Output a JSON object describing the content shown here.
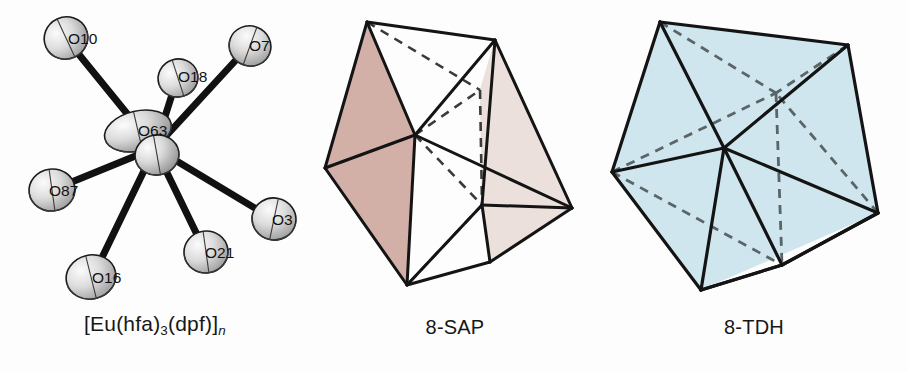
{
  "figure": {
    "type": "scientific-figure",
    "background_color": "#fdfdfd"
  },
  "panels": [
    {
      "id": "ortep",
      "kind": "ortep-crystal-structure",
      "caption": {
        "full_text": "[Eu(hfa)3(dpf)]n",
        "parts": [
          {
            "text": "[Eu(hfa)",
            "style": "normal"
          },
          {
            "text": "3",
            "style": "subscript"
          },
          {
            "text": "(dpf)]",
            "style": "normal"
          },
          {
            "text": "n",
            "style": "subscript-italic"
          }
        ]
      },
      "central_atom": {
        "label": "O63",
        "element": "Eu-center"
      },
      "ligand_atoms": [
        {
          "label": "O10",
          "position": "upper-left"
        },
        {
          "label": "O18",
          "position": "upper-middle"
        },
        {
          "label": "O7",
          "position": "upper-right"
        },
        {
          "label": "O87",
          "position": "left"
        },
        {
          "label": "O3",
          "position": "right"
        },
        {
          "label": "O16",
          "position": "lower-left"
        },
        {
          "label": "O21",
          "position": "lower-middle"
        }
      ],
      "style": {
        "bond_color": "#111111",
        "ellipsoid_light": "#e8e8e8",
        "ellipsoid_mid": "#b9b9b9",
        "ellipsoid_dark": "#8a8a8a",
        "outline_color": "#1b1b1b"
      }
    },
    {
      "id": "sap",
      "kind": "coordination-polyhedron",
      "caption": {
        "full_text": "8-SAP"
      },
      "geometry_name": "square antiprism",
      "coordination_number": 8,
      "style": {
        "face_front_color": "#d2b0a8",
        "face_side_color": "#ece0dc",
        "face_open_color": "#ffffff",
        "edge_color": "#141414",
        "hidden_edge_color": "#3a3a3a"
      }
    },
    {
      "id": "tdh",
      "kind": "coordination-polyhedron",
      "caption": {
        "full_text": "8-TDH"
      },
      "geometry_name": "triangular dodecahedron",
      "coordination_number": 8,
      "style": {
        "face_color": "#cfe6ee",
        "edge_color": "#141414",
        "hidden_edge_color": "#5a6568"
      }
    }
  ]
}
